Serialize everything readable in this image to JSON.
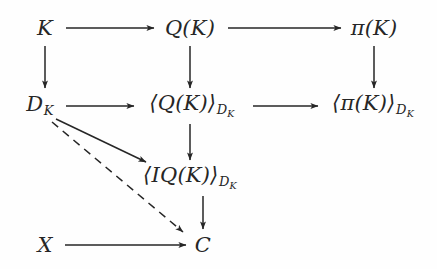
{
  "figure": {
    "kind": "commutative-diagram",
    "background_color": "#fefefe",
    "ink_color": "#262626"
  },
  "nodes": {
    "k": {
      "label": "K",
      "x": 45,
      "y": 28
    },
    "qk": {
      "label": "Q(K)",
      "x": 190,
      "y": 28
    },
    "pik": {
      "label": "π(K)",
      "x": 374,
      "y": 28
    },
    "dk": {
      "base": "D",
      "sub": "K",
      "x": 40,
      "y": 106
    },
    "qk_dk": {
      "base": "⟨Q(K)⟩",
      "sub": "D",
      "subsub": "K",
      "x": 192,
      "y": 106
    },
    "pik_dk": {
      "base": "⟨π(K)⟩",
      "sub": "D",
      "subsub": "K",
      "x": 373,
      "y": 106
    },
    "iqk_dk": {
      "base": "⟨IQ(K)⟩",
      "sub": "D",
      "subsub": "K",
      "x": 190,
      "y": 178
    },
    "x": {
      "label": "X",
      "x": 45,
      "y": 245
    },
    "c": {
      "label": "C",
      "x": 203,
      "y": 245
    }
  },
  "arrows": [
    {
      "name": "k-to-qk",
      "style": "solid",
      "from": "K",
      "to": "Q(K)",
      "orientation": "horizontal"
    },
    {
      "name": "qk-to-pik",
      "style": "solid",
      "from": "Q(K)",
      "to": "π(K)",
      "orientation": "horizontal"
    },
    {
      "name": "k-to-dk",
      "style": "solid",
      "from": "K",
      "to": "D_K",
      "orientation": "vertical"
    },
    {
      "name": "qk-to-qk-dk",
      "style": "solid",
      "from": "Q(K)",
      "to": "⟨Q(K)⟩_{D_K}",
      "orientation": "vertical"
    },
    {
      "name": "pik-to-pik-dk",
      "style": "solid",
      "from": "π(K)",
      "to": "⟨π(K)⟩_{D_K}",
      "orientation": "vertical"
    },
    {
      "name": "dk-to-qk-dk",
      "style": "solid",
      "from": "D_K",
      "to": "⟨Q(K)⟩_{D_K}",
      "orientation": "horizontal"
    },
    {
      "name": "qk-dk-to-pik-dk",
      "style": "solid",
      "from": "⟨Q(K)⟩_{D_K}",
      "to": "⟨π(K)⟩_{D_K}",
      "orientation": "horizontal"
    },
    {
      "name": "qk-dk-to-iqk-dk",
      "style": "solid",
      "from": "⟨Q(K)⟩_{D_K}",
      "to": "⟨IQ(K)⟩_{D_K}",
      "orientation": "vertical"
    },
    {
      "name": "dk-to-iqk-dk",
      "style": "solid",
      "from": "D_K",
      "to": "⟨IQ(K)⟩_{D_K}",
      "orientation": "diagonal"
    },
    {
      "name": "dk-to-c",
      "style": "dashed",
      "from": "D_K",
      "to": "C",
      "orientation": "diagonal"
    },
    {
      "name": "iqk-dk-to-c",
      "style": "solid",
      "from": "⟨IQ(K)⟩_{D_K}",
      "to": "C",
      "orientation": "vertical"
    },
    {
      "name": "x-to-c",
      "style": "solid",
      "from": "X",
      "to": "C",
      "orientation": "horizontal"
    }
  ]
}
